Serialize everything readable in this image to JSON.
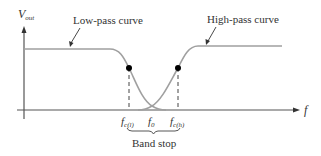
{
  "diagram": {
    "y_axis": {
      "label_main": "V",
      "label_sub": "out"
    },
    "x_axis": {
      "label": "f"
    },
    "curves": [
      {
        "name": "Low-pass curve",
        "label": "Low-pass curve"
      },
      {
        "name": "High-pass curve",
        "label": "High-pass curve"
      }
    ],
    "ticks": [
      {
        "main": "f",
        "sub": "c(l)"
      },
      {
        "main": "f",
        "sub": "0"
      },
      {
        "main": "f",
        "sub": "c(h)"
      }
    ],
    "brace_label": "Band stop",
    "colors": {
      "curve": "#a0a0a0",
      "axis": "#444444",
      "dot": "#000000",
      "text": "#333333"
    }
  }
}
